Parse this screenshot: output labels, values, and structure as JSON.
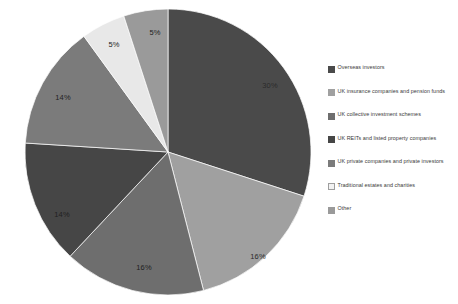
{
  "chart_data": {
    "type": "pie",
    "title": "",
    "categories": [
      "Overseas investors",
      "UK insurance companies and pension funds",
      "UK collective investment schemes",
      "UK REITs and listed property companies",
      "UK private companies and private investors",
      "Traditional estates and charities",
      "Other"
    ],
    "values": [
      30,
      16,
      16,
      14,
      14,
      5,
      5
    ],
    "value_labels": [
      "30%",
      "16%",
      "16%",
      "14%",
      "14%",
      "5%",
      "5%"
    ],
    "colors": [
      "#4a4a4a",
      "#a0a0a0",
      "#6e6e6e",
      "#464646",
      "#7b7b7b",
      "#e8e8e8",
      "#9a9a9a"
    ],
    "start_angle_deg": 0,
    "direction": "clockwise",
    "legend_position": "right",
    "grid": false,
    "background": "#ffffff"
  },
  "legend": {
    "items": [
      {
        "label": "Overseas investors",
        "swatch": "#4a4a4a",
        "border": "#4a4a4a"
      },
      {
        "label": "UK insurance companies and pension funds",
        "swatch": "#a0a0a0",
        "border": "#a0a0a0"
      },
      {
        "label": "UK collective investment schemes",
        "swatch": "#6e6e6e",
        "border": "#6e6e6e"
      },
      {
        "label": "UK REITs and listed property companies",
        "swatch": "#464646",
        "border": "#464646"
      },
      {
        "label": "UK private companies and private investors",
        "swatch": "#7b7b7b",
        "border": "#7b7b7b"
      },
      {
        "label": "Traditional estates and charities",
        "swatch": "#f2f2f2",
        "border": "#9e9e9e"
      },
      {
        "label": "Other",
        "swatch": "#9a9a9a",
        "border": "#9a9a9a"
      }
    ]
  },
  "slice_labels": [
    {
      "text": "30%",
      "x": 248,
      "y": 77,
      "dark": false
    },
    {
      "text": "16%",
      "x": 236,
      "y": 248,
      "dark": false
    },
    {
      "text": "16%",
      "x": 122,
      "y": 259,
      "dark": true
    },
    {
      "text": "14%",
      "x": 40,
      "y": 206,
      "dark": true
    },
    {
      "text": "14%",
      "x": 41,
      "y": 89,
      "dark": true
    },
    {
      "text": "5%",
      "x": 92,
      "y": 36,
      "dark": true
    },
    {
      "text": "5%",
      "x": 133,
      "y": 24,
      "dark": true
    }
  ]
}
